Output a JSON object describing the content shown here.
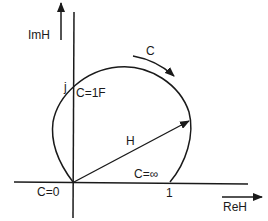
{
  "diagram": {
    "axes": {
      "imaginary_label": "ImH",
      "real_label": "ReH"
    },
    "points": {
      "origin_label": "C=0",
      "top_intercept_value": "j",
      "top_intercept_label": "C=1F",
      "real_intercept_value": "1",
      "real_intercept_label": "C=∞"
    },
    "vector_label": "H",
    "direction_label": "C",
    "colors": {
      "ink": "#1a1a1a",
      "background": "#ffffff"
    }
  }
}
